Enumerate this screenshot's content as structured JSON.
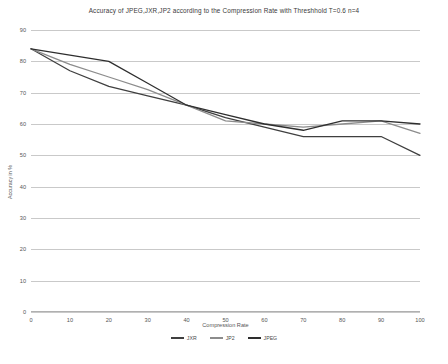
{
  "chart_data": {
    "type": "line",
    "title": "Accuracy of JPEG,JXR,JP2 according to the Compression Rate with Threshhold T=0.6 n=4",
    "xlabel": "Compression Rate",
    "ylabel": "Accuracy in %",
    "x": [
      0,
      10,
      20,
      30,
      40,
      50,
      60,
      70,
      80,
      90,
      100
    ],
    "xlim": [
      0,
      100
    ],
    "ylim": [
      0,
      90
    ],
    "yticks": [
      90,
      80,
      70,
      60,
      50,
      40,
      30,
      20,
      10,
      0
    ],
    "xticks": [
      0,
      10,
      20,
      30,
      40,
      50,
      60,
      70,
      80,
      90,
      100
    ],
    "grid": "horizontal",
    "legend_position": "bottom",
    "series": [
      {
        "name": "JXR",
        "color": "#3f3f3f",
        "values": [
          84,
          77,
          72,
          69,
          66,
          62,
          59,
          56,
          56,
          56,
          50
        ]
      },
      {
        "name": "JP2",
        "color": "#8c8c8c",
        "values": [
          84,
          79,
          75,
          71,
          66,
          61,
          60,
          59,
          60,
          61,
          57
        ]
      },
      {
        "name": "JPEG",
        "color": "#2e2e2e",
        "values": [
          84,
          82,
          80,
          73,
          66,
          63,
          60,
          58,
          61,
          61,
          60
        ]
      }
    ]
  },
  "yticks_text": [
    "90",
    "80",
    "70",
    "60",
    "50",
    "40",
    "30",
    "20",
    "10",
    "0"
  ],
  "xticks_text": [
    "0",
    "10",
    "20",
    "30",
    "40",
    "50",
    "60",
    "70",
    "80",
    "90",
    "100"
  ]
}
